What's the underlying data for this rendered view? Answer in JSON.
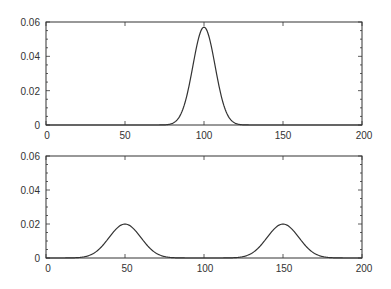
{
  "chart_data": [
    {
      "type": "line",
      "title": "",
      "xlabel": "",
      "ylabel": "",
      "xlim": [
        0,
        200
      ],
      "ylim": [
        0,
        0.06
      ],
      "grid": false,
      "legend": null,
      "xticks": [
        0,
        50,
        100,
        150,
        200
      ],
      "xtick_labels": [
        "0",
        "50",
        "100",
        "150",
        "200"
      ],
      "yticks": [
        0,
        0.02,
        0.04,
        0.06
      ],
      "ytick_labels": [
        "0",
        "0.02",
        "0.04",
        "0.06"
      ],
      "y_minor_step": 0.005,
      "series": [
        {
          "name": "unimodal gaussian",
          "description": "Single Gaussian centered at 100, sigma about 7, peak about 0.057",
          "mean": 100,
          "sigma": 7,
          "weight": 1.0,
          "points": [
            [
              0,
              0
            ],
            [
              70,
              0.0002
            ],
            [
              80,
              0.0021
            ],
            [
              85,
              0.0058
            ],
            [
              90,
              0.0206
            ],
            [
              95,
              0.0443
            ],
            [
              100,
              0.057
            ],
            [
              105,
              0.0443
            ],
            [
              110,
              0.0206
            ],
            [
              115,
              0.0058
            ],
            [
              120,
              0.0021
            ],
            [
              130,
              0.0002
            ],
            [
              200,
              0
            ]
          ]
        }
      ],
      "color": "#333333"
    },
    {
      "type": "line",
      "title": "",
      "xlabel": "",
      "ylabel": "",
      "xlim": [
        0,
        200
      ],
      "ylim": [
        0,
        0.06
      ],
      "grid": false,
      "legend": null,
      "xticks": [
        0,
        50,
        100,
        150,
        200
      ],
      "xtick_labels": [
        "0",
        "50",
        "100",
        "150",
        "200"
      ],
      "yticks": [
        0,
        0.02,
        0.04,
        0.06
      ],
      "ytick_labels": [
        "0",
        "0.02",
        "0.04",
        "0.06"
      ],
      "y_minor_step": 0.005,
      "series": [
        {
          "name": "bimodal gaussian mixture",
          "description": "Equal mixture of two Gaussians centered at 50 and 150, sigma about 10, peaks about 0.02",
          "components": [
            {
              "mean": 50,
              "sigma": 10,
              "weight": 0.5
            },
            {
              "mean": 150,
              "sigma": 10,
              "weight": 0.5
            }
          ],
          "points": [
            [
              0,
              0
            ],
            [
              20,
              0.0002
            ],
            [
              30,
              0.0027
            ],
            [
              40,
              0.0121
            ],
            [
              50,
              0.0199
            ],
            [
              60,
              0.0121
            ],
            [
              70,
              0.0027
            ],
            [
              80,
              0.0002
            ],
            [
              100,
              0
            ],
            [
              120,
              0.0002
            ],
            [
              130,
              0.0027
            ],
            [
              140,
              0.0121
            ],
            [
              150,
              0.0199
            ],
            [
              160,
              0.0121
            ],
            [
              170,
              0.0027
            ],
            [
              180,
              0.0002
            ],
            [
              200,
              0
            ]
          ]
        }
      ],
      "color": "#333333"
    }
  ],
  "plots": [
    {
      "id": "top",
      "y_labels": [
        "0",
        "0.02",
        "0.04",
        "0.06"
      ],
      "x_labels": [
        "0",
        "50",
        "100",
        "150",
        "200"
      ]
    },
    {
      "id": "bottom",
      "y_labels": [
        "0",
        "0.02",
        "0.04",
        "0.06"
      ],
      "x_labels": [
        "0",
        "50",
        "100",
        "150",
        "200"
      ]
    }
  ]
}
